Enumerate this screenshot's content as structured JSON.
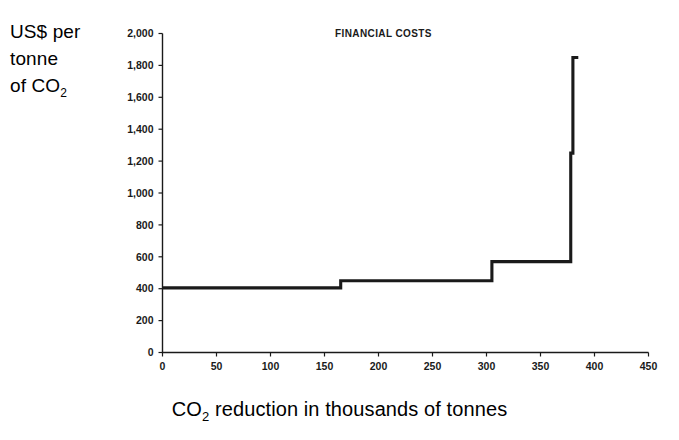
{
  "chart_data": {
    "type": "line",
    "subtype": "step",
    "title": "FINANCIAL COSTS",
    "xlabel": "CO2 reduction in thousands of tonnes",
    "xlabel_parts": {
      "prefix": "CO",
      "sub": "2",
      "suffix": " reduction in thousands of tonnes"
    },
    "ylabel": "US$ per tonne of CO2",
    "ylabel_lines": [
      "US$ per",
      "tonne",
      "of CO"
    ],
    "ylabel_sub": "2",
    "xlim": [
      0,
      450
    ],
    "ylim": [
      0,
      2000
    ],
    "xticks": [
      0,
      50,
      100,
      150,
      200,
      250,
      300,
      350,
      400,
      450
    ],
    "xtick_labels": [
      "0",
      "50",
      "100",
      "150",
      "200",
      "250",
      "300",
      "350",
      "400",
      "450"
    ],
    "yticks": [
      0,
      200,
      400,
      600,
      800,
      1000,
      1200,
      1400,
      1600,
      1800,
      2000
    ],
    "ytick_labels": [
      "0",
      "200",
      "400",
      "600",
      "800",
      "1,000",
      "1,200",
      "1,400",
      "1,600",
      "1,800",
      "2,000"
    ],
    "grid": false,
    "legend": false,
    "line_color": "#1a1a1a",
    "steps": [
      {
        "x_start": 0,
        "x_end": 165,
        "y": 405
      },
      {
        "x_start": 165,
        "x_end": 305,
        "y": 450
      },
      {
        "x_start": 305,
        "x_end": 378,
        "y": 570
      },
      {
        "x_start": 378,
        "x_end": 380,
        "y": 1250
      },
      {
        "x_start": 380,
        "x_end": 385,
        "y": 1850
      }
    ],
    "points": [
      {
        "x": 0,
        "y": 405
      },
      {
        "x": 165,
        "y": 405
      },
      {
        "x": 165,
        "y": 450
      },
      {
        "x": 305,
        "y": 450
      },
      {
        "x": 305,
        "y": 570
      },
      {
        "x": 378,
        "y": 570
      },
      {
        "x": 378,
        "y": 1250
      },
      {
        "x": 380,
        "y": 1250
      },
      {
        "x": 380,
        "y": 1850
      },
      {
        "x": 385,
        "y": 1850
      }
    ]
  }
}
